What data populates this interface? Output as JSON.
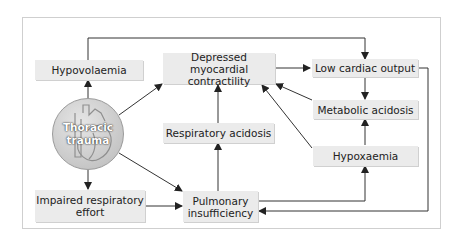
{
  "diagram": {
    "center": {
      "label_line1": "Thoracic",
      "label_line2": "trauma",
      "icon": "heart-icon"
    },
    "nodes": {
      "hypovolaemia": "Hypovolaemia",
      "depressed_line1": "Depressed myocardial",
      "depressed_line2": "contractility",
      "low_cardiac_output": "Low cardiac output",
      "metabolic_acidosis": "Metabolic acidosis",
      "respiratory_acidosis": "Respiratory acidosis",
      "hypoxaemia": "Hypoxaemia",
      "impaired_line1": "Impaired respiratory",
      "impaired_line2": "effort",
      "pulmonary_line1": "Pulmonary",
      "pulmonary_line2": "insufficiency"
    },
    "edges": [
      {
        "from": "Thoracic trauma",
        "to": "Hypovolaemia"
      },
      {
        "from": "Thoracic trauma",
        "to": "Depressed myocardial contractility"
      },
      {
        "from": "Thoracic trauma",
        "to": "Impaired respiratory effort"
      },
      {
        "from": "Thoracic trauma",
        "to": "Pulmonary insufficiency"
      },
      {
        "from": "Hypovolaemia",
        "to": "Low cardiac output"
      },
      {
        "from": "Depressed myocardial contractility",
        "to": "Low cardiac output"
      },
      {
        "from": "Low cardiac output",
        "to": "Metabolic acidosis"
      },
      {
        "from": "Low cardiac output",
        "to": "Pulmonary insufficiency"
      },
      {
        "from": "Metabolic acidosis",
        "to": "Depressed myocardial contractility"
      },
      {
        "from": "Hypoxaemia",
        "to": "Metabolic acidosis"
      },
      {
        "from": "Hypoxaemia",
        "to": "Depressed myocardial contractility"
      },
      {
        "from": "Respiratory acidosis",
        "to": "Depressed myocardial contractility"
      },
      {
        "from": "Pulmonary insufficiency",
        "to": "Respiratory acidosis"
      },
      {
        "from": "Pulmonary insufficiency",
        "to": "Hypoxaemia"
      },
      {
        "from": "Impaired respiratory effort",
        "to": "Pulmonary insufficiency"
      }
    ],
    "colors": {
      "box_fill": "#ebebeb",
      "line": "#222222",
      "frame": "#cfcfcf",
      "circle": "#c8c8c8"
    }
  }
}
